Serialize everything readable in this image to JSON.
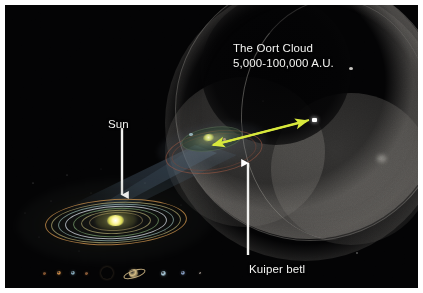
{
  "figure": {
    "kind": "astronomy-diagram",
    "title_text": "The Oort Cloud",
    "background_color": "#030304",
    "border_color": "#ffffff"
  },
  "labels": {
    "oort_cloud_name": "The Oort Cloud",
    "oort_cloud_distance": "5,000-100,000 A.U.",
    "sun": "Sun",
    "kuiper_belt": "Kuiper betl"
  },
  "annotations": {
    "sun_arrow": {
      "name": "white-down-arrow",
      "color": "#ffffff",
      "direction": "down",
      "points_to": "Sun"
    },
    "kuiper_arrow": {
      "name": "white-up-arrow",
      "color": "#ffffff",
      "direction": "up",
      "points_to": "Kuiper betl"
    },
    "scale_arrow": {
      "name": "yellow-double-arrow",
      "color": "#d8e83c",
      "direction": "double-headed",
      "spans": "Kuiper belt to Oort Cloud edge"
    }
  },
  "features": {
    "oort_cloud_shell": "translucent grey spherical shell with cutaway",
    "kuiper_belt_disc": "small tilted disc with reddish outer ring",
    "inner_solar_system": "concentric elliptical orbits around bright sun",
    "magnification_cone": "bluish-grey cone linking inner system to Kuiper belt"
  },
  "orbit_colors": [
    "#c48c4a",
    "#b0a870",
    "#96b6b0",
    "#ced4dc",
    "#78a06e",
    "#beb478",
    "#aa9664"
  ],
  "planets": [
    {
      "name": "mercury",
      "color": "#b5703a",
      "size": 3,
      "x": 4
    },
    {
      "name": "venus",
      "color": "#d8924a",
      "size": 4,
      "x": 18
    },
    {
      "name": "earth",
      "color": "#8fb6c8",
      "size": 4,
      "x": 32
    },
    {
      "name": "mars",
      "color": "#c07a46",
      "size": 3,
      "x": 46
    },
    {
      "name": "jupiter",
      "color": "#cfa878",
      "size": 12,
      "x": 62
    },
    {
      "name": "saturn",
      "color": "#d4bc84",
      "size": 9,
      "x": 90
    },
    {
      "name": "uranus",
      "color": "#a8c8d8",
      "size": 5,
      "x": 122
    },
    {
      "name": "neptune",
      "color": "#8fa8d0",
      "size": 4,
      "x": 142
    },
    {
      "name": "pluto",
      "color": "#b0a49a",
      "size": 2,
      "x": 160
    }
  ]
}
